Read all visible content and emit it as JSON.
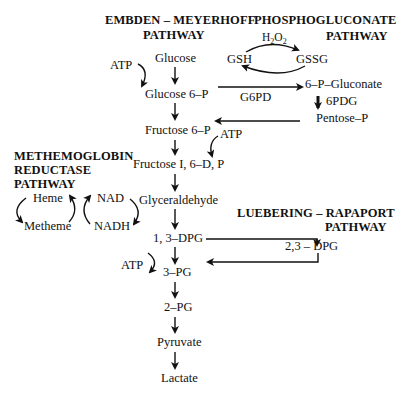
{
  "pathways": {
    "embden_meyerhoff": {
      "title_line1": "EMBDEN – MEYERHOFF",
      "title_line2": "PATHWAY",
      "steps": [
        "Glucose",
        "Glucose 6–P",
        "Fructose 6–P",
        "Fructose I, 6–D, P",
        "Glyceraldehyde",
        "1, 3–DPG",
        "3–PG",
        "2–PG",
        "Pyruvate",
        "Lactate"
      ],
      "atp_labels": [
        "ATP",
        "ATP",
        "ATP"
      ]
    },
    "phosphogluconate": {
      "title_line1": "PHOSPHOGLUCONATE",
      "title_line2": "PATHWAY",
      "h2o2": "H",
      "h2o2_sub1": "2",
      "h2o2_o": "O",
      "h2o2_sub2": "2",
      "gsh": "GSH",
      "gssg": "GSSG",
      "enzyme": "G6PD",
      "product": "6–P–Gluconate",
      "enzyme2": "6PDG",
      "pentose": "Pentose–P"
    },
    "methemoglobin_reductase": {
      "title_line1": "METHEMOGLOBIN",
      "title_line2": "REDUCTASE",
      "title_line3": "PATHWAY",
      "heme": "Heme",
      "metheme": "Metheme",
      "nad": "NAD",
      "nadh": "NADH"
    },
    "luebering_rapaport": {
      "title_line1": "LUEBERING – RAPAPORT",
      "title_line2": "PATHWAY",
      "product": "2,3 – DPG"
    }
  }
}
